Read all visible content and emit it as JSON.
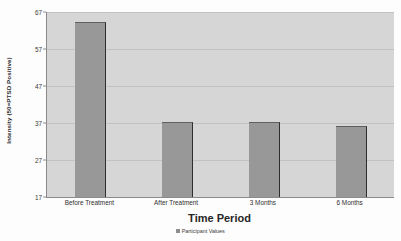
{
  "chart_data": {
    "type": "bar",
    "title": "",
    "categories": [
      "Before Treatment",
      "After Treatment",
      "3 Months",
      "6 Months"
    ],
    "values": [
      64,
      37,
      37,
      36
    ],
    "series": [
      {
        "name": "Participant Values",
        "values": [
          64,
          37,
          37,
          36
        ]
      }
    ],
    "xlabel": "Time Period",
    "ylabel": "Intensity (50=PTSD Positive)",
    "ylim": [
      17,
      67
    ],
    "yticks": [
      17,
      27,
      37,
      47,
      57,
      67
    ],
    "ytick_labels": [
      "17",
      "27",
      "37",
      "47",
      "57",
      "67"
    ],
    "grid": true,
    "legend": {
      "position": "bottom",
      "entries": [
        "Participant Values"
      ]
    },
    "colors": {
      "bar_fill": "#989898",
      "bar_edge": "#2e2e2e",
      "plot_background": "#d6d6d6",
      "gridline": "#c2c2c2",
      "axis": "#8a8a8a",
      "text": "#2b2b2b",
      "figure_background": "#fdfdfd"
    }
  }
}
